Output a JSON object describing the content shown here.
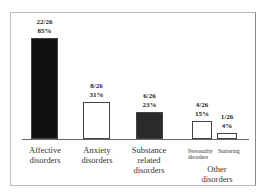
{
  "chart_data": {
    "type": "bar",
    "title": "",
    "xlabel": "",
    "ylabel": "",
    "categories": [
      "Affective disorders",
      "Anxiety disorders",
      "Substance related disorders",
      "Personality disorders",
      "Stuttering disorders"
    ],
    "values": [
      85,
      31,
      23,
      15,
      4
    ],
    "counts": [
      "22/26",
      "8/26",
      "6/26",
      "4/26",
      "1/26"
    ],
    "percent_labels": [
      "85%",
      "31%",
      "23%",
      "15%",
      "4%"
    ],
    "group_label": "Other disorders",
    "group_members": [
      "Personality disorders",
      "Stuttering disorders"
    ],
    "bar_fills": [
      "#111111",
      "#ffffff",
      "#2a2a2a",
      "#ffffff",
      "#ffffff"
    ],
    "grid": false,
    "legend": "none",
    "ylim": [
      0,
      100
    ]
  },
  "labels": {
    "cat1": [
      "Affective",
      "disorders"
    ],
    "cat2": [
      "Anxiety",
      "disorders"
    ],
    "cat3": [
      "Substance",
      "related",
      "disorders"
    ],
    "cat4": "Personality",
    "cat4b": "disorders",
    "cat5": "Stuttering",
    "group": [
      "Other",
      "disorders"
    ]
  }
}
